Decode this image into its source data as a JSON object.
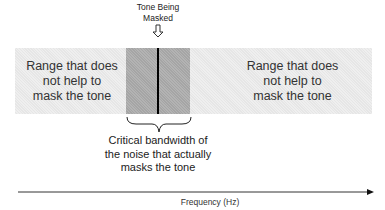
{
  "diagram": {
    "tone_label": "Tone Being\nMasked",
    "tone_label_lines": [
      "Tone Being",
      "Masked"
    ],
    "left_range": {
      "lines": [
        "Range that does",
        "not help to",
        "mask the tone"
      ]
    },
    "right_range": {
      "lines": [
        "Range that does",
        "not help to",
        "mask the tone"
      ]
    },
    "critical_band": {
      "lines": [
        "Critical bandwidth of",
        "the noise that actually",
        "masks the tone"
      ]
    },
    "axis": {
      "label": "Frequency (Hz)",
      "direction": "right"
    },
    "colors": {
      "outer_band": "#e6e6e6",
      "critical_band": "#b3b3b3",
      "tone_line": "#000000",
      "axis": "#333333"
    }
  }
}
